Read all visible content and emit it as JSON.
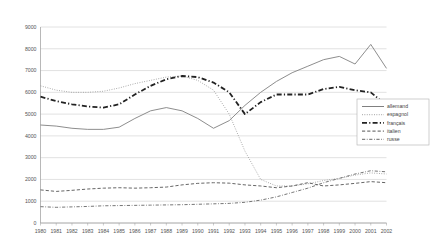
{
  "chart_data": {
    "type": "line",
    "title": "",
    "xlabel": "",
    "ylabel": "",
    "ylim": [
      0,
      9000
    ],
    "ytick_step": 1000,
    "grid": true,
    "legend_position": "right-middle",
    "yticks": [
      "0",
      "1000",
      "2000",
      "3000",
      "4000",
      "5000",
      "6000",
      "7000",
      "8000",
      "9000"
    ],
    "categories": [
      "1980",
      "1981",
      "1982",
      "1983",
      "1984",
      "1985",
      "1986",
      "1987",
      "1988",
      "1989",
      "1990",
      "1991",
      "1992",
      "1993",
      "1994",
      "1995",
      "1996",
      "1997",
      "1998",
      "1999",
      "2000",
      "2001",
      "2002"
    ],
    "series": [
      {
        "name": "allemand",
        "style": "solid",
        "color": "#808080",
        "width": 0.9,
        "values": [
          4500,
          4450,
          4350,
          4300,
          4300,
          4400,
          4800,
          5150,
          5300,
          5150,
          4800,
          4350,
          4700,
          5400,
          6000,
          6500,
          6900,
          7200,
          7500,
          7650,
          7300,
          8200,
          7100
        ]
      },
      {
        "name": "espagnol",
        "style": "dotted",
        "color": "#999999",
        "width": 0.9,
        "values": [
          6300,
          6100,
          6000,
          6000,
          6050,
          6200,
          6400,
          6550,
          6700,
          6750,
          6550,
          6100,
          5000,
          3300,
          2000,
          1700,
          1700,
          1800,
          1950,
          2050,
          2200,
          2300,
          2250
        ]
      },
      {
        "name": "français",
        "style": "dash-dot-thick",
        "color": "#222222",
        "width": 1.8,
        "values": [
          5800,
          5600,
          5450,
          5350,
          5300,
          5450,
          5900,
          6300,
          6600,
          6750,
          6700,
          6450,
          6000,
          5000,
          5550,
          5900,
          5900,
          5900,
          6150,
          6250,
          6100,
          6000,
          5400
        ]
      },
      {
        "name": "italien",
        "style": "dashed",
        "color": "#555555",
        "width": 0.9,
        "values": [
          1520,
          1450,
          1500,
          1560,
          1600,
          1620,
          1600,
          1620,
          1650,
          1750,
          1820,
          1850,
          1830,
          1750,
          1700,
          1620,
          1700,
          1850,
          1700,
          1750,
          1820,
          1900,
          1850
        ]
      },
      {
        "name": "russe",
        "style": "dash-dot",
        "color": "#666666",
        "width": 0.9,
        "values": [
          750,
          720,
          740,
          760,
          790,
          800,
          810,
          820,
          830,
          840,
          860,
          880,
          900,
          950,
          1050,
          1200,
          1400,
          1600,
          1850,
          2050,
          2250,
          2400,
          2350
        ]
      }
    ],
    "legend_entries": [
      {
        "label": "allemand",
        "style": "solid",
        "color": "#808080",
        "width": 1.0
      },
      {
        "label": "espagnol",
        "style": "dotted",
        "color": "#999999",
        "width": 1.0
      },
      {
        "label": "français",
        "style": "dash-dot-thick",
        "color": "#222222",
        "width": 1.9
      },
      {
        "label": "italien",
        "style": "dashed",
        "color": "#555555",
        "width": 1.0
      },
      {
        "label": "russe",
        "style": "dash-dot",
        "color": "#666666",
        "width": 1.0
      }
    ]
  }
}
